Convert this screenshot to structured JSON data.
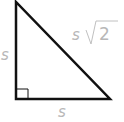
{
  "diagram": {
    "type": "right-isosceles-triangle",
    "labels": {
      "left_leg": "s",
      "bottom_leg": "s",
      "hypotenuse_coef": "s",
      "hypotenuse_radicand": "2"
    },
    "colors": {
      "stroke": "#111111",
      "label": "#b8b8b8"
    }
  }
}
